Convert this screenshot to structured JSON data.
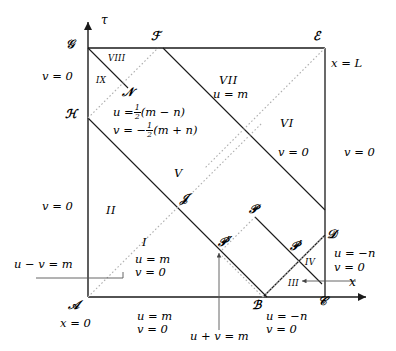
{
  "figure": {
    "type": "spacetime-characteristic-diagram",
    "axes": {
      "vertical_label": "τ",
      "horizontal_label": "x"
    },
    "corner_points": [
      {
        "name": "A",
        "label": "𝒜",
        "x": 88,
        "y": 297
      },
      {
        "name": "B",
        "label": "ℬ",
        "x": 263,
        "y": 297
      },
      {
        "name": "C",
        "label": "𝒞",
        "x": 325,
        "y": 297
      },
      {
        "name": "D",
        "label": "𝒟",
        "x": 325,
        "y": 238
      },
      {
        "name": "E",
        "label": "ℰ",
        "x": 325,
        "y": 48
      },
      {
        "name": "F",
        "label": "ℱ",
        "x": 163,
        "y": 48
      },
      {
        "name": "G",
        "label": "𝒢",
        "x": 88,
        "y": 48
      },
      {
        "name": "H",
        "label": "ℋ",
        "x": 88,
        "y": 118
      },
      {
        "name": "J",
        "label": "𝒥",
        "x": 186,
        "y": 200
      },
      {
        "name": "N",
        "label": "𝒩",
        "x": 128,
        "y": 93
      },
      {
        "name": "P",
        "label": "𝒫",
        "x": 255,
        "y": 213
      },
      {
        "name": "P1",
        "label": "𝒫′",
        "x": 297,
        "y": 250
      },
      {
        "name": "P2",
        "label": "𝒫″",
        "x": 226,
        "y": 246
      }
    ],
    "regions": [
      {
        "id": "I",
        "label": "I",
        "x": 146,
        "y": 244
      },
      {
        "id": "II",
        "label": "II",
        "x": 112,
        "y": 212
      },
      {
        "id": "III",
        "label": "III",
        "x": 296,
        "y": 285
      },
      {
        "id": "IV",
        "label": "IV",
        "x": 311,
        "y": 265
      },
      {
        "id": "V",
        "label": "V",
        "x": 178,
        "y": 175
      },
      {
        "id": "VI",
        "label": "VI",
        "x": 287,
        "y": 125
      },
      {
        "id": "VII",
        "label": "VII",
        "x": 229,
        "y": 82
      },
      {
        "id": "VIII",
        "label": "VIII",
        "x": 117,
        "y": 60
      },
      {
        "id": "IX",
        "label": "IX",
        "x": 103,
        "y": 82
      }
    ],
    "equations": {
      "region_I": {
        "line1": "u = m",
        "line2": "v = 0"
      },
      "region_VI": {
        "line1": "v = 0"
      },
      "region_VII": {
        "line1": "u = m"
      },
      "region_N": {
        "line1": "u =",
        "frac1_num": "1",
        "frac1_den": "2",
        "line1_tail": "(m − n)",
        "line2": "v = −",
        "frac2_num": "1",
        "frac2_den": "2",
        "line2_tail": "(m + n)"
      },
      "bottom_A": {
        "label": "x = 0"
      },
      "bottom_mid": {
        "line1": "u = m",
        "line2": "v = 0"
      },
      "bottom_B": {
        "line1": "u = −n",
        "line2": "v = 0"
      },
      "bottom_callout": {
        "label": "u + v = m"
      },
      "left_upper": {
        "label": "v = 0"
      },
      "left_lower": {
        "label": "v = 0"
      },
      "left_callout": {
        "label": "u − v = m"
      },
      "right_top": {
        "label": "x = L"
      },
      "right_v0": {
        "label": "v = 0"
      },
      "right_D": {
        "line1": "u = −n",
        "line2": "v = 0"
      }
    }
  },
  "colors": {
    "stroke": "#1a1a1a",
    "dashed": "#b0b0b0",
    "background": "#ffffff"
  }
}
